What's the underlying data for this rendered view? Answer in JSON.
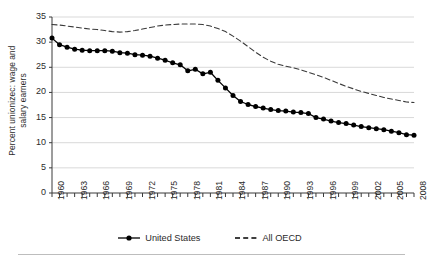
{
  "chart_data": {
    "type": "line",
    "title": "",
    "subtitle": "",
    "xlabel": "",
    "ylabel": "Percent unionizec: wage and salary earners",
    "ylabel_line1": "Percent unionizec: wage and",
    "ylabel_line2": "salary earners",
    "ylim": [
      0,
      35
    ],
    "yticks": [
      0,
      5,
      10,
      15,
      20,
      25,
      30,
      35
    ],
    "xlim": [
      1960,
      2008
    ],
    "xticks": [
      1960,
      1963,
      1966,
      1969,
      1972,
      1975,
      1978,
      1981,
      1984,
      1987,
      1990,
      1993,
      1996,
      1999,
      2002,
      2005,
      2008
    ],
    "grid": "horizontal",
    "legend_position": "bottom-center",
    "x": [
      1960,
      1961,
      1962,
      1963,
      1964,
      1965,
      1966,
      1967,
      1968,
      1969,
      1970,
      1971,
      1972,
      1973,
      1974,
      1975,
      1976,
      1977,
      1978,
      1979,
      1980,
      1981,
      1982,
      1983,
      1984,
      1985,
      1986,
      1987,
      1988,
      1989,
      1990,
      1991,
      1992,
      1993,
      1994,
      1995,
      1996,
      1997,
      1998,
      1999,
      2000,
      2001,
      2002,
      2003,
      2004,
      2005,
      2006,
      2007,
      2008
    ],
    "series": [
      {
        "name": "United States",
        "style": "solid",
        "marker": "filled-circle",
        "color": "#000000",
        "values": [
          30.8,
          29.5,
          29.0,
          28.6,
          28.4,
          28.3,
          28.3,
          28.3,
          28.2,
          27.9,
          27.8,
          27.5,
          27.4,
          27.2,
          26.8,
          26.4,
          25.9,
          25.5,
          24.3,
          24.6,
          23.7,
          24.0,
          22.4,
          20.9,
          19.4,
          18.2,
          17.6,
          17.2,
          16.9,
          16.6,
          16.4,
          16.3,
          16.1,
          16.0,
          15.8,
          15.0,
          14.7,
          14.3,
          14.0,
          13.8,
          13.5,
          13.2,
          13.0,
          12.8,
          12.6,
          12.3,
          12.0,
          11.6,
          11.5
        ]
      },
      {
        "name": "All OECD",
        "style": "dashed",
        "marker": "none",
        "color": "#3a3a3a",
        "values": [
          33.5,
          33.4,
          33.2,
          33.0,
          32.8,
          32.6,
          32.5,
          32.3,
          32.1,
          32.0,
          32.1,
          32.3,
          32.6,
          32.9,
          33.2,
          33.4,
          33.5,
          33.6,
          33.6,
          33.6,
          33.5,
          33.2,
          32.7,
          32.1,
          31.2,
          30.2,
          29.1,
          28.0,
          27.0,
          26.2,
          25.6,
          25.2,
          24.9,
          24.5,
          24.0,
          23.5,
          23.0,
          22.4,
          21.8,
          21.2,
          20.7,
          20.2,
          19.8,
          19.4,
          19.0,
          18.7,
          18.4,
          18.1,
          18.0
        ]
      }
    ],
    "legend": [
      {
        "label": "United States",
        "style": "solid",
        "marker": "filled-circle"
      },
      {
        "label": "All OECD",
        "style": "dashed",
        "marker": "none"
      }
    ]
  },
  "axis": {
    "ytick_labels": [
      "35",
      "30",
      "25",
      "20",
      "15",
      "10",
      "5",
      "0"
    ],
    "xtick_labels": [
      "1960",
      "1963",
      "1966",
      "1969",
      "1972",
      "1975",
      "1978",
      "1981",
      "1984",
      "1987",
      "1990",
      "1993",
      "1996",
      "1999",
      "2002",
      "2005",
      "2008"
    ]
  },
  "colors": {
    "grid": "#d9d9d9",
    "axis": "#3a3a3a",
    "us_series": "#000000",
    "oecd_series": "#3a3a3a",
    "rule": "#bdbdbd"
  }
}
